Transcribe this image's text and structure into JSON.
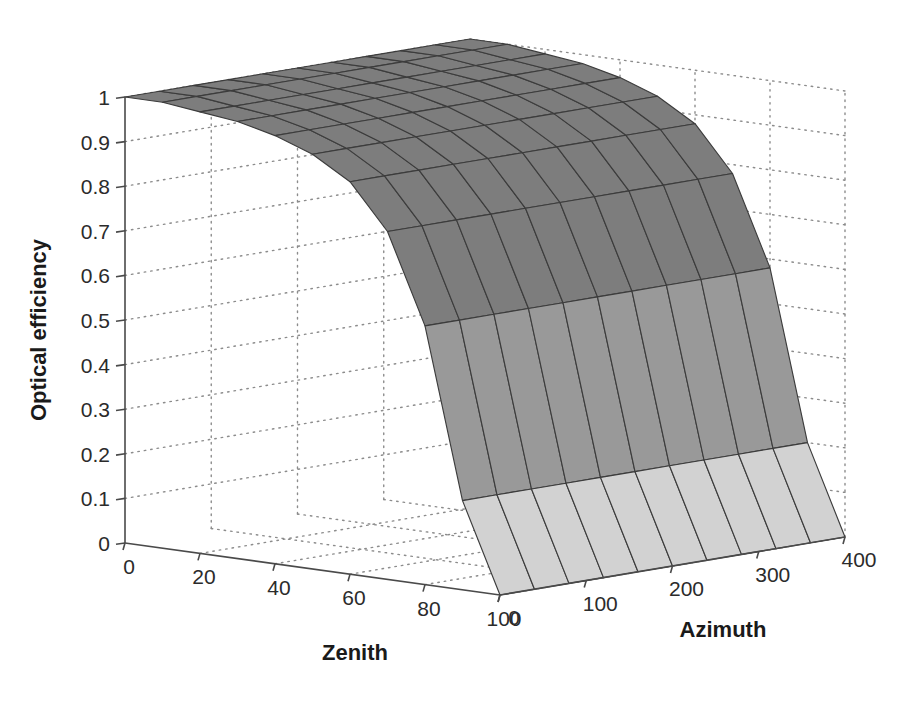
{
  "chart_data": {
    "type": "surface",
    "title": "",
    "xlabel": "Zenith",
    "ylabel": "Azimuth",
    "zlabel": "Optical efficiency",
    "grid": true,
    "legend": "none",
    "projection": "3d",
    "colormap": "grayscale",
    "shading": "faceted",
    "x": [
      0,
      10,
      20,
      30,
      40,
      50,
      60,
      70,
      80,
      90,
      100
    ],
    "xlim": [
      0,
      100
    ],
    "xticks": [
      0,
      20,
      40,
      60,
      80,
      100
    ],
    "xticklabels": [
      "0",
      "20",
      "40",
      "60",
      "80",
      "100"
    ],
    "y": [
      0,
      40,
      80,
      120,
      160,
      200,
      240,
      280,
      320,
      360,
      400
    ],
    "ylim": [
      0,
      400
    ],
    "yticks": [
      0,
      100,
      200,
      300,
      400
    ],
    "yticklabels": [
      "0",
      "100",
      "200",
      "300",
      "400"
    ],
    "zlim": [
      0,
      1
    ],
    "zticks": [
      0,
      0.1,
      0.2,
      0.3,
      0.4,
      0.5,
      0.6,
      0.7,
      0.8,
      0.9,
      1
    ],
    "zticklabels": [
      "0",
      "0.1",
      "0.2",
      "0.3",
      "0.4",
      "0.5",
      "0.6",
      "0.7",
      "0.8",
      "0.9",
      "1"
    ],
    "z_rows_note": "rows indexed by x (Zenith 0..100), columns by y (Azimuth 0..400)",
    "z": [
      [
        1.0,
        1.0,
        1.0,
        1.0,
        1.0,
        1.0,
        1.0,
        1.0,
        1.0,
        1.0,
        1.0
      ],
      [
        1.0,
        1.0,
        1.0,
        1.0,
        1.0,
        1.0,
        1.0,
        1.0,
        1.0,
        1.0,
        1.0
      ],
      [
        0.99,
        0.99,
        0.99,
        0.99,
        0.99,
        0.99,
        0.99,
        0.99,
        0.99,
        0.99,
        0.99
      ],
      [
        0.98,
        0.98,
        0.98,
        0.98,
        0.98,
        0.98,
        0.98,
        0.98,
        0.98,
        0.98,
        0.98
      ],
      [
        0.96,
        0.96,
        0.96,
        0.96,
        0.96,
        0.96,
        0.96,
        0.96,
        0.96,
        0.96,
        0.96
      ],
      [
        0.93,
        0.93,
        0.93,
        0.93,
        0.93,
        0.93,
        0.93,
        0.93,
        0.93,
        0.93,
        0.93
      ],
      [
        0.88,
        0.88,
        0.88,
        0.88,
        0.88,
        0.88,
        0.88,
        0.88,
        0.88,
        0.88,
        0.88
      ],
      [
        0.78,
        0.78,
        0.78,
        0.78,
        0.78,
        0.78,
        0.78,
        0.78,
        0.78,
        0.78,
        0.78
      ],
      [
        0.58,
        0.58,
        0.58,
        0.58,
        0.58,
        0.58,
        0.58,
        0.58,
        0.58,
        0.58,
        0.58
      ],
      [
        0.2,
        0.2,
        0.2,
        0.2,
        0.2,
        0.2,
        0.2,
        0.2,
        0.2,
        0.2,
        0.2
      ],
      [
        0.0,
        0.0,
        0.0,
        0.0,
        0.0,
        0.0,
        0.0,
        0.0,
        0.0,
        0.0,
        0.0
      ]
    ],
    "colors": {
      "band_high": "#7d7d7d",
      "band_mid": "#999999",
      "band_low": "#d2d2d2",
      "edge": "#3c3c3c",
      "axis": "#4a4a4a",
      "grid": "#8c8c8c",
      "text": "#2b2b2b",
      "background": "#ffffff"
    },
    "band_breaks": [
      0.0,
      0.33,
      0.62,
      1.01
    ]
  },
  "axes": {
    "z_title": "Optical efficiency",
    "x_title": "Zenith",
    "y_title": "Azimuth"
  }
}
